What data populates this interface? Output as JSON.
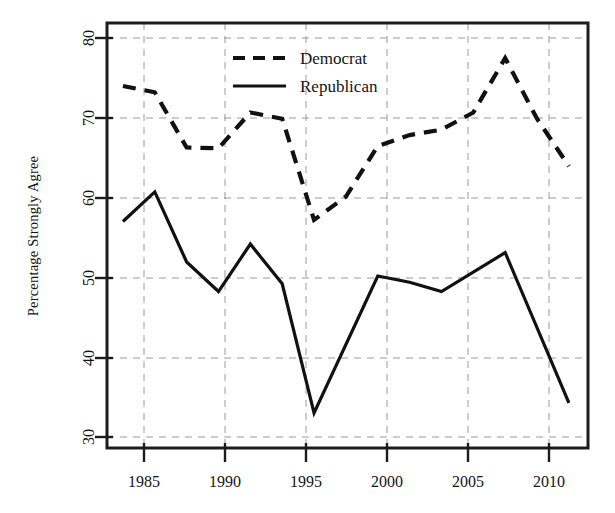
{
  "chart_data": {
    "type": "line",
    "title": "",
    "subtitle": "",
    "xlabel": "",
    "ylabel": "Percentage Strongly Agree",
    "xlim": [
      1983.0,
      2013.2
    ],
    "ylim": [
      27.7,
      82.3
    ],
    "grid": true,
    "grid_style": "dashed",
    "legend_position": "top-center",
    "xticks": [
      1985,
      1990,
      1995,
      2000,
      2005,
      2010
    ],
    "xtick_labels": [
      "1985",
      "1990",
      "1995",
      "2000",
      "2005",
      "2010"
    ],
    "yticks": [
      30,
      40,
      50,
      60,
      70,
      80
    ],
    "ytick_labels": [
      "30",
      "40",
      "50",
      "60",
      "70",
      "80"
    ],
    "series": [
      {
        "name": "Democrat",
        "style": "dashed",
        "color": "#111111",
        "x": [
          1984,
          1986,
          1988,
          1990,
          1992,
          1994,
          1996,
          1998,
          2000,
          2002,
          2004,
          2006,
          2008,
          2010,
          2012
        ],
        "values": [
          74.2,
          73.4,
          66.3,
          66.2,
          70.8,
          70.0,
          57.0,
          60.0,
          66.5,
          67.9,
          68.6,
          70.8,
          77.8,
          70.0,
          63.9
        ]
      },
      {
        "name": "Republican",
        "style": "solid",
        "color": "#111111",
        "x": [
          1984,
          1986,
          1988,
          1990,
          1992,
          1994,
          1996,
          2000,
          2002,
          2004,
          2008,
          2012
        ],
        "values": [
          56.8,
          60.6,
          51.6,
          47.8,
          53.9,
          48.8,
          32.2,
          49.8,
          49.0,
          47.8,
          52.8,
          33.5
        ]
      }
    ]
  },
  "legend": {
    "items": [
      {
        "label": "Democrat",
        "style": "dashed"
      },
      {
        "label": "Republican",
        "style": "solid"
      }
    ]
  },
  "axes": {
    "y_title": "Percentage Strongly Agree"
  }
}
